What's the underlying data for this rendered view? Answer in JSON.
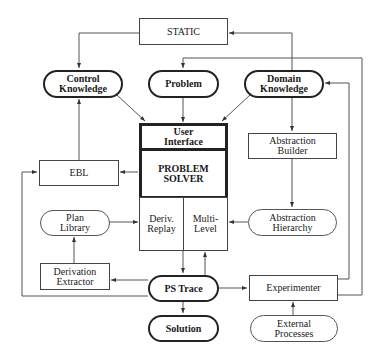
{
  "diagram": {
    "nodes": {
      "static": "STATIC",
      "control_knowledge": "Control\nKnowledge",
      "problem": "Problem",
      "domain_knowledge": "Domain\nKnowledge",
      "user_interface": "User\nInterface",
      "problem_solver": "PROBLEM\nSOLVER",
      "ebl": "EBL",
      "abstraction_builder": "Abstraction\nBuilder",
      "plan_library": "Plan\nLibrary",
      "deriv_replay": "Deriv.\nReplay",
      "multi_level": "Multi-\nLevel",
      "abstraction_hierarchy": "Abstraction\nHierarchy",
      "derivation_extractor": "Derivation\nExtractor",
      "ps_trace": "PS Trace",
      "experimenter": "Experimenter",
      "solution": "Solution",
      "external_processes": "External\nProcesses"
    },
    "edges": [
      {
        "from": "STATIC",
        "to": "Control Knowledge"
      },
      {
        "from": "Domain Knowledge",
        "to": "STATIC"
      },
      {
        "from": "Control Knowledge",
        "to": "User Interface"
      },
      {
        "from": "Problem",
        "to": "User Interface"
      },
      {
        "from": "Domain Knowledge",
        "to": "User Interface"
      },
      {
        "from": "Domain Knowledge",
        "to": "Abstraction Builder"
      },
      {
        "from": "Abstraction Builder",
        "to": "Abstraction Hierarchy"
      },
      {
        "from": "Abstraction Hierarchy",
        "to": "Multi-Level"
      },
      {
        "from": "PROBLEM SOLVER",
        "to": "EBL"
      },
      {
        "from": "EBL",
        "to": "Control Knowledge"
      },
      {
        "from": "Plan Library",
        "to": "Deriv. Replay"
      },
      {
        "from": "Derivation Extractor",
        "to": "Plan Library"
      },
      {
        "from": "PROBLEM SOLVER",
        "to": "PS Trace"
      },
      {
        "from": "PS Trace",
        "to": "PROBLEM SOLVER"
      },
      {
        "from": "PS Trace",
        "to": "Derivation Extractor"
      },
      {
        "from": "PS Trace",
        "to": "EBL"
      },
      {
        "from": "PS Trace",
        "to": "Experimenter"
      },
      {
        "from": "PS Trace",
        "to": "Solution"
      },
      {
        "from": "External Processes",
        "to": "Experimenter"
      },
      {
        "from": "Experimenter",
        "to": "Domain Knowledge"
      },
      {
        "from": "Experimenter",
        "to": "Problem"
      }
    ],
    "colors": {
      "line": "#444444",
      "background": "#ffffff"
    }
  }
}
